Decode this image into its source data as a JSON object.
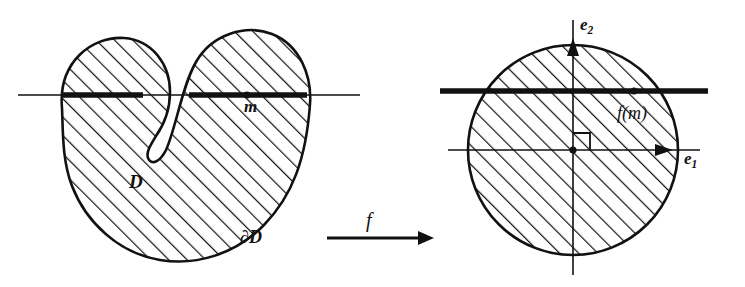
{
  "figure": {
    "background_color": "#ffffff",
    "ink_color": "#111111",
    "width": 745,
    "height": 287
  },
  "left_panel": {
    "name": "domain-panel",
    "shape_label": "D",
    "boundary_label": "∂D",
    "point_label": "m",
    "description": "kidney-shaped hatched region with a horizontal line through it"
  },
  "map_arrow": {
    "name": "mapping-arrow",
    "label": "f"
  },
  "right_panel": {
    "name": "disc-panel",
    "vertical_axis_label": "e",
    "vertical_axis_subscript": "2",
    "horizontal_axis_label": "e",
    "horizontal_axis_subscript": "1",
    "point_label": "f(m)",
    "description": "hatched disc with orthogonal axes, right-angle mark at origin and a horizontal chord"
  },
  "style": {
    "hatch_angle_left_deg": 45,
    "hatch_angle_right_deg": 45,
    "thin_line_width": 1.4,
    "thick_line_width": 5,
    "outline_width": 2.4
  }
}
